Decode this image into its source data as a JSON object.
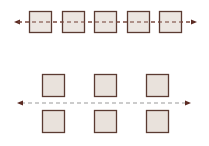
{
  "diagram": {
    "colors": {
      "box_fill": "#e9e2dc",
      "box_stroke": "#5b3b32",
      "axis_top": "#7a4a40",
      "axis_bottom": "#9a9a9a",
      "arrowhead": "#5b2a22"
    },
    "top_group": {
      "box_count": 5,
      "boxes": [
        {
          "x": 29,
          "y": 11,
          "w": 22,
          "h": 21
        },
        {
          "x": 62,
          "y": 11,
          "w": 22,
          "h": 21
        },
        {
          "x": 94,
          "y": 11,
          "w": 22,
          "h": 21
        },
        {
          "x": 127,
          "y": 11,
          "w": 22,
          "h": 21
        },
        {
          "x": 159,
          "y": 11,
          "w": 22,
          "h": 21
        }
      ],
      "axis": {
        "x1": 14,
        "x2": 197,
        "y": 22,
        "style": "dashed",
        "arrows": "both"
      }
    },
    "bottom_group": {
      "box_count": 6,
      "boxes": [
        {
          "x": 42,
          "y": 74,
          "w": 22,
          "h": 22
        },
        {
          "x": 94,
          "y": 74,
          "w": 22,
          "h": 22
        },
        {
          "x": 146,
          "y": 74,
          "w": 22,
          "h": 22
        },
        {
          "x": 42,
          "y": 110,
          "w": 22,
          "h": 22
        },
        {
          "x": 94,
          "y": 110,
          "w": 22,
          "h": 22
        },
        {
          "x": 146,
          "y": 110,
          "w": 22,
          "h": 22
        }
      ],
      "axis": {
        "x1": 17,
        "x2": 191,
        "y": 103,
        "style": "dashed",
        "arrows": "both"
      }
    }
  }
}
